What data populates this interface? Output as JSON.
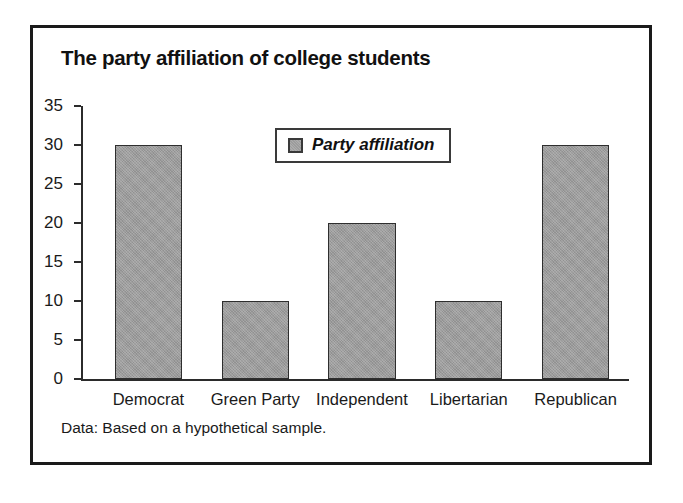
{
  "figure": {
    "title": "The party affiliation of college students",
    "footnote": "Data: Based on a hypothetical sample."
  },
  "chart_data": {
    "type": "bar",
    "title": "The party affiliation of college students",
    "categories": [
      "Democrat",
      "Green Party",
      "Independent",
      "Libertarian",
      "Republican"
    ],
    "values": [
      30,
      10,
      20,
      10,
      30
    ],
    "series": [
      {
        "name": "Party affiliation",
        "values": [
          30,
          10,
          20,
          10,
          30
        ]
      }
    ],
    "xlabel": "",
    "ylabel": "",
    "ylim": [
      0,
      35
    ],
    "ytick_labels": [
      "0",
      "5",
      "10",
      "15",
      "20",
      "25",
      "30",
      "35"
    ],
    "ytick_values": [
      0,
      5,
      10,
      15,
      20,
      25,
      30,
      35
    ],
    "grid": false,
    "legend": {
      "position": "top-center-inside",
      "entries": [
        "Party affiliation"
      ]
    },
    "annotations": [
      "Data: Based on a hypothetical sample."
    ],
    "colors": {
      "bar_fill": "#9c9c9c",
      "bar_edge": "#2e2e2e",
      "axis": "#2b2b2b",
      "frame": "#1a1a1a",
      "text": "#1a1a1a"
    }
  }
}
